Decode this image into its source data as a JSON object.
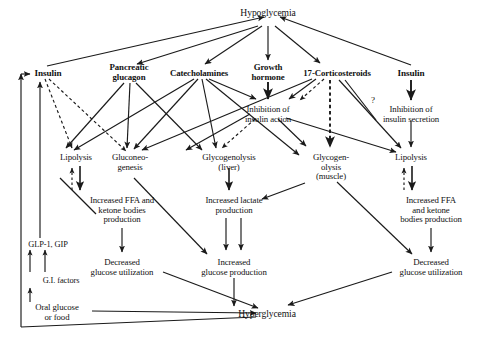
{
  "figure": {
    "type": "flow-diagram",
    "title_text": "",
    "domain": "physiology counterregulation diagram"
  },
  "nodes": {
    "hypoglycemia": {
      "label": "Hypoglycemia",
      "x": 228,
      "y": 8,
      "w": 80,
      "bold": false,
      "size": "s10"
    },
    "insulin_left": {
      "label": "Insulin",
      "x": 27,
      "y": 69,
      "w": 42,
      "bold": true,
      "size": "s95"
    },
    "pancreatic_glucagon": {
      "label": "Pancreatic\nglucagon",
      "x": 98,
      "y": 63,
      "w": 62,
      "bold": true,
      "size": "s9"
    },
    "catecholamines": {
      "label": "Catecholamines",
      "x": 160,
      "y": 69,
      "w": 78,
      "bold": true,
      "size": "s9"
    },
    "growth_hormone": {
      "label": "Growth\nhormone",
      "x": 244,
      "y": 63,
      "w": 48,
      "bold": true,
      "size": "s9"
    },
    "corticosteroids": {
      "label": "17-Corticosteroids",
      "x": 293,
      "y": 69,
      "w": 88,
      "bold": true,
      "size": "s9"
    },
    "insulin_right": {
      "label": "Insulin",
      "x": 400,
      "y": 69,
      "w": 42,
      "bold": true,
      "size": "s95"
    },
    "inhibition_insulin_action": {
      "label": "Inhibition of\ninsulin action",
      "x": 248,
      "y": 105,
      "w": 68,
      "bold": false,
      "size": "s9"
    },
    "inhibition_insulin_secretion": {
      "label": "Inhibition of\ninsulin secretion",
      "x": 386,
      "y": 105,
      "w": 76,
      "bold": false,
      "size": "s9"
    },
    "lipolysis_left": {
      "label": "Lipolysis",
      "x": 53,
      "y": 153,
      "w": 50,
      "bold": false,
      "size": "s9"
    },
    "gluconeogenesis": {
      "label": "Gluconeo-\ngenesis",
      "x": 117,
      "y": 153,
      "w": 52,
      "bold": false,
      "size": "s9"
    },
    "glycogenolysis_liver": {
      "label": "Glycogenolysis\n(liver)",
      "x": 200,
      "y": 153,
      "w": 76,
      "bold": false,
      "size": "s9"
    },
    "glycogenolysis_muscle": {
      "label": "Glycogen-\nolysis\n(muscle)",
      "x": 304,
      "y": 153,
      "w": 54,
      "bold": false,
      "size": "s9"
    },
    "lipolysis_right": {
      "label": "Lipolysis",
      "x": 400,
      "y": 153,
      "w": 50,
      "bold": false,
      "size": "s9"
    },
    "increased_ffa_left": {
      "label": "Increased FFA and\nketone bodies\nproduction",
      "x": 74,
      "y": 196,
      "w": 96,
      "bold": false,
      "size": "s9"
    },
    "increased_lactate": {
      "label": "Increased lactate\nproduction",
      "x": 196,
      "y": 196,
      "w": 84,
      "bold": false,
      "size": "s9"
    },
    "increased_ffa_right": {
      "label": "Increased FFA\nand ketone\nbodies production",
      "x": 385,
      "y": 196,
      "w": 92,
      "bold": false,
      "size": "s9"
    },
    "decreased_util_left": {
      "label": "Decreased\nglucose utilization",
      "x": 79,
      "y": 258,
      "w": 88,
      "bold": false,
      "size": "s9"
    },
    "increased_glucose_production": {
      "label": "Increased\nglucose production",
      "x": 192,
      "y": 258,
      "w": 92,
      "bold": false,
      "size": "s9"
    },
    "decreased_util_right": {
      "label": "Decreased\nglucose utilization",
      "x": 389,
      "y": 258,
      "w": 90,
      "bold": false,
      "size": "s9"
    },
    "glp1_gip": {
      "label": "GLP-1, GIP",
      "x": 21,
      "y": 240,
      "w": 60,
      "bold": false,
      "size": "s85"
    },
    "gi_factors": {
      "label": "G.I. factors",
      "x": 33,
      "y": 278,
      "w": 56,
      "bold": false,
      "size": "s85"
    },
    "oral_glucose": {
      "label": "Oral glucose\nor food",
      "x": 24,
      "y": 303,
      "w": 66,
      "bold": false,
      "size": "s9"
    },
    "hyperglycemia": {
      "label": "Hyperglycemia",
      "x": 227,
      "y": 314,
      "w": 80,
      "bold": false,
      "size": "s10"
    },
    "question_mark": {
      "label": "?",
      "x": 368,
      "y": 96,
      "w": 10,
      "bold": false,
      "size": "s9"
    }
  },
  "edges": [
    {
      "from": "insulin_left",
      "to": "hypoglycemia",
      "style": "solid",
      "note": "low insulin path into hypoglycemia"
    },
    {
      "from": "insulin_right",
      "to": "hypoglycemia",
      "style": "solid",
      "note": "right insulin into hypoglycemia"
    },
    {
      "from": "hypoglycemia",
      "to": "pancreatic_glucagon",
      "style": "solid"
    },
    {
      "from": "hypoglycemia",
      "to": "catecholamines",
      "style": "solid"
    },
    {
      "from": "hypoglycemia",
      "to": "growth_hormone",
      "style": "solid"
    },
    {
      "from": "hypoglycemia",
      "to": "corticosteroids",
      "style": "solid"
    },
    {
      "from": "growth_hormone",
      "to": "inhibition_insulin_action",
      "style": "solid"
    },
    {
      "from": "corticosteroids",
      "to": "inhibition_insulin_action",
      "style": "dashed"
    },
    {
      "from": "catecholamines",
      "to": "inhibition_insulin_action",
      "style": "solid"
    },
    {
      "from": "insulin_right",
      "to": "inhibition_insulin_secretion",
      "style": "solid"
    },
    {
      "from": "inhibition_insulin_secretion",
      "to": "lipolysis_right",
      "style": "solid"
    },
    {
      "from": "insulin_left",
      "to": "lipolysis_left",
      "style": "dashed"
    },
    {
      "from": "insulin_left",
      "to": "gluconeogenesis",
      "style": "dashed"
    },
    {
      "from": "pancreatic_glucagon",
      "to": "lipolysis_left",
      "style": "solid"
    },
    {
      "from": "pancreatic_glucagon",
      "to": "gluconeogenesis",
      "style": "solid"
    },
    {
      "from": "pancreatic_glucagon",
      "to": "glycogenolysis_liver",
      "style": "solid"
    },
    {
      "from": "catecholamines",
      "to": "lipolysis_left",
      "style": "solid"
    },
    {
      "from": "catecholamines",
      "to": "gluconeogenesis",
      "style": "solid"
    },
    {
      "from": "catecholamines",
      "to": "glycogenolysis_liver",
      "style": "solid"
    },
    {
      "from": "catecholamines",
      "to": "glycogenolysis_muscle",
      "style": "solid"
    },
    {
      "from": "corticosteroids",
      "to": "gluconeogenesis",
      "style": "solid"
    },
    {
      "from": "corticosteroids",
      "to": "glycogenolysis_muscle",
      "style": "dashed"
    },
    {
      "from": "corticosteroids",
      "to": "lipolysis_right",
      "style": "solid"
    },
    {
      "from": "inhibition_insulin_action",
      "to": "glycogenolysis_liver",
      "style": "dashed"
    },
    {
      "from": "inhibition_insulin_action",
      "to": "glycogenolysis_muscle",
      "style": "solid"
    },
    {
      "from": "inhibition_insulin_action",
      "to": "lipolysis_right",
      "style": "solid"
    },
    {
      "from": "lipolysis_left",
      "to": "increased_ffa_left",
      "style": "solid"
    },
    {
      "from": "increased_ffa_left",
      "to": "lipolysis_left",
      "style": "dashed"
    },
    {
      "from": "lipolysis_right",
      "to": "increased_ffa_right",
      "style": "solid"
    },
    {
      "from": "increased_ffa_right",
      "to": "lipolysis_right",
      "style": "dashed"
    },
    {
      "from": "increased_ffa_left",
      "to": "decreased_util_left",
      "style": "solid"
    },
    {
      "from": "increased_ffa_right",
      "to": "decreased_util_right",
      "style": "solid"
    },
    {
      "from": "glycogenolysis_liver",
      "to": "increased_lactate",
      "style": "solid"
    },
    {
      "from": "glycogenolysis_muscle",
      "to": "increased_lactate",
      "style": "solid"
    },
    {
      "from": "increased_lactate",
      "to": "increased_glucose_production",
      "style": "solid"
    },
    {
      "from": "gluconeogenesis",
      "to": "increased_glucose_production",
      "style": "solid"
    },
    {
      "from": "glycogenolysis_muscle",
      "to": "increased_glucose_production",
      "style": "solid"
    },
    {
      "from": "increased_glucose_production",
      "to": "hyperglycemia",
      "style": "solid"
    },
    {
      "from": "decreased_util_left",
      "to": "hyperglycemia",
      "style": "solid"
    },
    {
      "from": "decreased_util_right",
      "to": "hyperglycemia",
      "style": "solid"
    },
    {
      "from": "oral_glucose",
      "to": "hyperglycemia",
      "style": "solid"
    },
    {
      "from": "oral_glucose",
      "to": "gi_factors",
      "style": "solid"
    },
    {
      "from": "gi_factors",
      "to": "glp1_gip",
      "style": "solid"
    },
    {
      "from": "glp1_gip",
      "to": "insulin_left",
      "style": "solid"
    },
    {
      "from": "hyperglycemia",
      "to": "insulin_left",
      "style": "solid",
      "note": "feedback loop along left border"
    }
  ],
  "legend": {
    "solid_meaning": "stimulation / direct effect",
    "dashed_meaning": "inhibition or indirect / uncertain effect",
    "question_meaning": "uncertain pathway"
  },
  "colors": {
    "line": "#1a1a1a",
    "text": "#111111",
    "background": "#ffffff"
  }
}
